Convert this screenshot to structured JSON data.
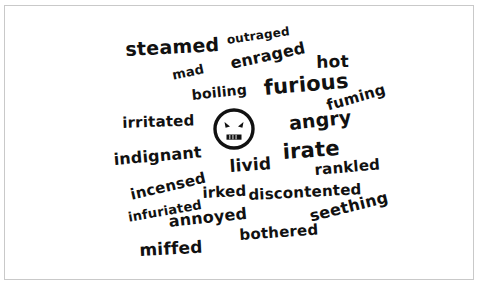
{
  "figure": {
    "kind": "word-cloud",
    "topic": "anger synonyms",
    "background_color": "#ffffff",
    "text_color": "#111111",
    "border_color": "#c9c9c9",
    "center_icon": "angry-face-icon"
  },
  "words": [
    {
      "text": "steamed",
      "x": 120,
      "y": 34,
      "size": 19,
      "rotate": -3
    },
    {
      "text": "outraged",
      "x": 221,
      "y": 28,
      "size": 12,
      "rotate": -8
    },
    {
      "text": "hot",
      "x": 311,
      "y": 48,
      "size": 17,
      "rotate": -2
    },
    {
      "text": "mad",
      "x": 166,
      "y": 63,
      "size": 13,
      "rotate": -12
    },
    {
      "text": "enraged",
      "x": 224,
      "y": 50,
      "size": 16,
      "rotate": -12
    },
    {
      "text": "boiling",
      "x": 186,
      "y": 82,
      "size": 14,
      "rotate": -6
    },
    {
      "text": "furious",
      "x": 258,
      "y": 72,
      "size": 21,
      "rotate": -5
    },
    {
      "text": "fuming",
      "x": 320,
      "y": 93,
      "size": 15,
      "rotate": -16
    },
    {
      "text": "irritated",
      "x": 117,
      "y": 110,
      "size": 15,
      "rotate": -2
    },
    {
      "text": "angry",
      "x": 283,
      "y": 108,
      "size": 19,
      "rotate": -6
    },
    {
      "text": "indignant",
      "x": 108,
      "y": 146,
      "size": 16,
      "rotate": -5
    },
    {
      "text": "livid",
      "x": 224,
      "y": 152,
      "size": 17,
      "rotate": -4
    },
    {
      "text": "irate",
      "x": 277,
      "y": 136,
      "size": 21,
      "rotate": -4
    },
    {
      "text": "rankled",
      "x": 309,
      "y": 157,
      "size": 15,
      "rotate": -5
    },
    {
      "text": "incensed",
      "x": 124,
      "y": 182,
      "size": 15,
      "rotate": -13
    },
    {
      "text": "irked",
      "x": 197,
      "y": 180,
      "size": 15,
      "rotate": -3
    },
    {
      "text": "discontented",
      "x": 243,
      "y": 182,
      "size": 15,
      "rotate": -3
    },
    {
      "text": "infuriated",
      "x": 122,
      "y": 205,
      "size": 13,
      "rotate": -10
    },
    {
      "text": "annoyed",
      "x": 163,
      "y": 208,
      "size": 16,
      "rotate": -6
    },
    {
      "text": "seething",
      "x": 303,
      "y": 203,
      "size": 16,
      "rotate": -14
    },
    {
      "text": "bothered",
      "x": 234,
      "y": 222,
      "size": 15,
      "rotate": -4
    },
    {
      "text": "miffed",
      "x": 134,
      "y": 236,
      "size": 17,
      "rotate": -3
    }
  ]
}
